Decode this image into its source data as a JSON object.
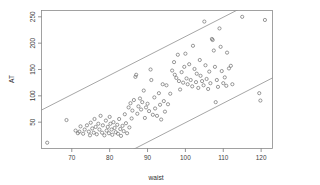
{
  "chart_data": {
    "type": "scatter",
    "title": "",
    "subtitle": "",
    "xlabel": "waist",
    "ylabel": "AT",
    "xlim": [
      62,
      123
    ],
    "ylim": [
      0,
      262
    ],
    "xticks": [
      70,
      80,
      90,
      100,
      110,
      120
    ],
    "yticks": [
      50,
      100,
      150,
      200,
      250
    ],
    "xticklabels": [
      "70",
      "80",
      "90",
      "100",
      "110",
      "120"
    ],
    "yticklabels": [
      "50",
      "100",
      "150",
      "200",
      "250"
    ],
    "grid": false,
    "legend": null,
    "marker": "open-circle",
    "marker_color": "#6e6e6e",
    "frame_color": "#8a8a8a",
    "points": [
      [
        63.5,
        11
      ],
      [
        68.6,
        54
      ],
      [
        71.0,
        34
      ],
      [
        71.6,
        29
      ],
      [
        72.0,
        32
      ],
      [
        72.3,
        42
      ],
      [
        73.0,
        28
      ],
      [
        73.4,
        36
      ],
      [
        74.0,
        44
      ],
      [
        74.5,
        32
      ],
      [
        74.8,
        25
      ],
      [
        75.0,
        49
      ],
      [
        75.4,
        38
      ],
      [
        75.8,
        30
      ],
      [
        76.0,
        56
      ],
      [
        76.3,
        41
      ],
      [
        76.6,
        27
      ],
      [
        77.0,
        47
      ],
      [
        77.3,
        36
      ],
      [
        77.6,
        62
      ],
      [
        78.0,
        30
      ],
      [
        78.2,
        44
      ],
      [
        78.6,
        25
      ],
      [
        79.0,
        53
      ],
      [
        79.2,
        34
      ],
      [
        79.5,
        41
      ],
      [
        79.8,
        29
      ],
      [
        80.0,
        60
      ],
      [
        80.2,
        47
      ],
      [
        80.5,
        36
      ],
      [
        80.7,
        26
      ],
      [
        81.0,
        50
      ],
      [
        81.3,
        39
      ],
      [
        81.6,
        31
      ],
      [
        82.0,
        45
      ],
      [
        82.2,
        28
      ],
      [
        82.5,
        56
      ],
      [
        82.8,
        37
      ],
      [
        83.0,
        24
      ],
      [
        83.4,
        43
      ],
      [
        83.7,
        33
      ],
      [
        84.0,
        65
      ],
      [
        84.3,
        48
      ],
      [
        84.6,
        29
      ],
      [
        85.0,
        78
      ],
      [
        85.2,
        40
      ],
      [
        85.5,
        86
      ],
      [
        85.8,
        57
      ],
      [
        86.0,
        72
      ],
      [
        86.4,
        92
      ],
      [
        86.8,
        136
      ],
      [
        87.0,
        140
      ],
      [
        87.3,
        66
      ],
      [
        87.6,
        80
      ],
      [
        88.0,
        95
      ],
      [
        88.3,
        74
      ],
      [
        88.6,
        88
      ],
      [
        89.0,
        110
      ],
      [
        89.3,
        58
      ],
      [
        89.6,
        78
      ],
      [
        90.0,
        85
      ],
      [
        90.4,
        71
      ],
      [
        90.8,
        150
      ],
      [
        91.0,
        130
      ],
      [
        91.4,
        64
      ],
      [
        91.8,
        97
      ],
      [
        92.0,
        76
      ],
      [
        92.5,
        62
      ],
      [
        93.0,
        105
      ],
      [
        93.3,
        83
      ],
      [
        93.6,
        55
      ],
      [
        94.0,
        122
      ],
      [
        94.3,
        90
      ],
      [
        94.6,
        70
      ],
      [
        95.0,
        120
      ],
      [
        95.4,
        84
      ],
      [
        96.0,
        104
      ],
      [
        96.5,
        148
      ],
      [
        97.0,
        164
      ],
      [
        97.2,
        140
      ],
      [
        97.6,
        134
      ],
      [
        98.0,
        178
      ],
      [
        98.3,
        128
      ],
      [
        98.6,
        112
      ],
      [
        99.0,
        145
      ],
      [
        99.4,
        125
      ],
      [
        99.7,
        155
      ],
      [
        100.0,
        180
      ],
      [
        100.3,
        133
      ],
      [
        100.6,
        122
      ],
      [
        101.0,
        160
      ],
      [
        101.4,
        130
      ],
      [
        101.8,
        118
      ],
      [
        102.0,
        195
      ],
      [
        102.4,
        151
      ],
      [
        102.8,
        126
      ],
      [
        103.0,
        142
      ],
      [
        103.4,
        115
      ],
      [
        103.8,
        168
      ],
      [
        104.0,
        138
      ],
      [
        104.4,
        128
      ],
      [
        104.8,
        120
      ],
      [
        105.0,
        241
      ],
      [
        105.3,
        158
      ],
      [
        105.6,
        132
      ],
      [
        106.0,
        113
      ],
      [
        106.3,
        146
      ],
      [
        106.6,
        124
      ],
      [
        107.0,
        208
      ],
      [
        107.2,
        206
      ],
      [
        107.5,
        186
      ],
      [
        107.8,
        155
      ],
      [
        108.0,
        88
      ],
      [
        108.3,
        130
      ],
      [
        108.6,
        117
      ],
      [
        109.0,
        228
      ],
      [
        109.3,
        193
      ],
      [
        109.6,
        147
      ],
      [
        110.0,
        124
      ],
      [
        110.4,
        135
      ],
      [
        110.8,
        119
      ],
      [
        111.0,
        182
      ],
      [
        111.5,
        152
      ],
      [
        112.0,
        157
      ],
      [
        112.4,
        122
      ],
      [
        115.0,
        250
      ],
      [
        119.5,
        105
      ],
      [
        119.8,
        91
      ],
      [
        121.0,
        244
      ]
    ],
    "reference_lines": [
      {
        "name": "upper-boundary",
        "p1": [
          62.0,
          73
        ],
        "p2": [
          123.0,
          297
        ],
        "style": "solid"
      },
      {
        "name": "lower-boundary",
        "p1": [
          74.0,
          -47
        ],
        "p2": [
          123.0,
          134
        ],
        "style": "solid"
      }
    ]
  }
}
